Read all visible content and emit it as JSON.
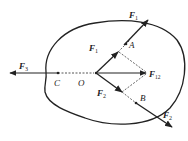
{
  "diagram": {
    "type": "force-diagram",
    "colors": {
      "stroke": "#222222",
      "dashed": "#555555",
      "background": "#ffffff"
    },
    "points": [
      {
        "id": "O",
        "label": "O"
      },
      {
        "id": "A",
        "label": "A"
      },
      {
        "id": "B",
        "label": "B"
      },
      {
        "id": "C",
        "label": "C"
      }
    ],
    "forces": {
      "F1_outer": {
        "main": "F",
        "sub": "1"
      },
      "F1_inner": {
        "main": "F",
        "sub": "1"
      },
      "F2_outer": {
        "main": "F",
        "sub": "2"
      },
      "F2_inner": {
        "main": "F",
        "sub": "2"
      },
      "F3": {
        "main": "F",
        "sub": "3"
      },
      "F12": {
        "main": "F",
        "sub": "12"
      }
    }
  }
}
